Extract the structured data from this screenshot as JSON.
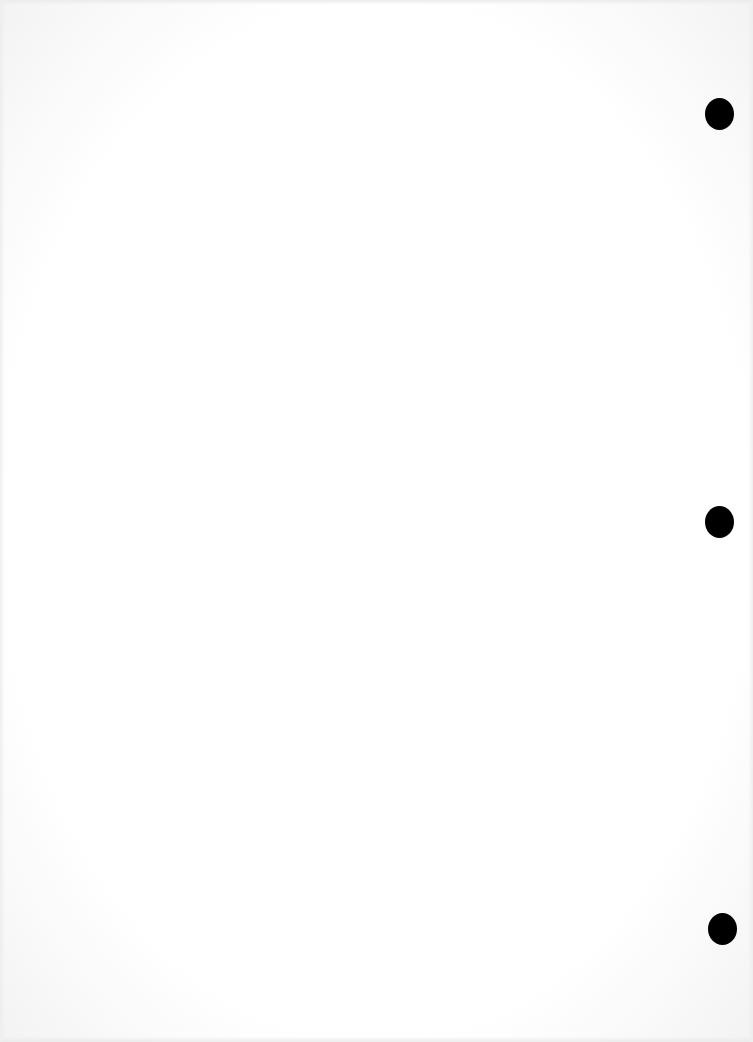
{
  "document": {
    "type": "blank scanned page",
    "background_color": "#ffffff",
    "punch_holes": [
      {
        "id": "top",
        "cx": 719,
        "cy": 114,
        "w": 29,
        "h": 32,
        "color": "#000000"
      },
      {
        "id": "middle",
        "cx": 719,
        "cy": 522,
        "w": 29,
        "h": 32,
        "color": "#000000"
      },
      {
        "id": "bottom",
        "cx": 722,
        "cy": 929,
        "w": 29,
        "h": 32,
        "color": "#000000"
      }
    ]
  }
}
